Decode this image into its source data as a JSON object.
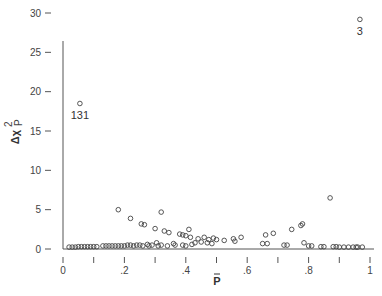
{
  "chart_data": {
    "type": "scatter",
    "title": "",
    "xlabel": "P̂",
    "ylabel": "Δχ²_P",
    "xlim": [
      0,
      1
    ],
    "ylim": [
      0,
      30
    ],
    "grid": false,
    "legend": null,
    "x_ticks": [
      0,
      0.1,
      0.2,
      0.3,
      0.4,
      0.5,
      0.6,
      0.7,
      0.8,
      0.9,
      1
    ],
    "x_tick_labels": [
      "0",
      "",
      ".2",
      "",
      ".4",
      "",
      ".6",
      "",
      ".8",
      "",
      "1"
    ],
    "y_ticks": [
      0,
      5,
      10,
      15,
      20,
      25,
      30
    ],
    "y_tick_labels": [
      "0",
      "5",
      "10",
      "15",
      "20",
      "25",
      "30"
    ],
    "marker": "open-circle",
    "annotations": [
      {
        "label": "131",
        "x": 0.055,
        "y": 18.3
      },
      {
        "label": "3",
        "x": 0.967,
        "y": 29.0
      }
    ],
    "points": [
      {
        "x": 0.055,
        "y": 18.3
      },
      {
        "x": 0.967,
        "y": 29.0
      },
      {
        "x": 0.18,
        "y": 4.8
      },
      {
        "x": 0.22,
        "y": 3.7
      },
      {
        "x": 0.255,
        "y": 3.0
      },
      {
        "x": 0.265,
        "y": 2.9
      },
      {
        "x": 0.32,
        "y": 4.5
      },
      {
        "x": 0.3,
        "y": 2.4
      },
      {
        "x": 0.33,
        "y": 2.1
      },
      {
        "x": 0.345,
        "y": 1.9
      },
      {
        "x": 0.305,
        "y": 0.6
      },
      {
        "x": 0.275,
        "y": 0.4
      },
      {
        "x": 0.24,
        "y": 0.3
      },
      {
        "x": 0.38,
        "y": 1.7
      },
      {
        "x": 0.39,
        "y": 1.6
      },
      {
        "x": 0.4,
        "y": 1.5
      },
      {
        "x": 0.41,
        "y": 2.3
      },
      {
        "x": 0.415,
        "y": 1.3
      },
      {
        "x": 0.44,
        "y": 1.1
      },
      {
        "x": 0.46,
        "y": 1.3
      },
      {
        "x": 0.475,
        "y": 1.0
      },
      {
        "x": 0.49,
        "y": 1.2
      },
      {
        "x": 0.5,
        "y": 1.0
      },
      {
        "x": 0.525,
        "y": 0.9
      },
      {
        "x": 0.555,
        "y": 1.1
      },
      {
        "x": 0.56,
        "y": 0.8
      },
      {
        "x": 0.58,
        "y": 1.3
      },
      {
        "x": 0.36,
        "y": 0.5
      },
      {
        "x": 0.365,
        "y": 0.3
      },
      {
        "x": 0.42,
        "y": 0.4
      },
      {
        "x": 0.43,
        "y": 0.6
      },
      {
        "x": 0.45,
        "y": 0.7
      },
      {
        "x": 0.47,
        "y": 0.6
      },
      {
        "x": 0.485,
        "y": 0.5
      },
      {
        "x": 0.65,
        "y": 0.5
      },
      {
        "x": 0.665,
        "y": 0.5
      },
      {
        "x": 0.66,
        "y": 1.6
      },
      {
        "x": 0.685,
        "y": 1.8
      },
      {
        "x": 0.72,
        "y": 0.3
      },
      {
        "x": 0.73,
        "y": 0.3
      },
      {
        "x": 0.745,
        "y": 2.3
      },
      {
        "x": 0.775,
        "y": 2.8
      },
      {
        "x": 0.78,
        "y": 3.0
      },
      {
        "x": 0.785,
        "y": 0.6
      },
      {
        "x": 0.8,
        "y": 0.2
      },
      {
        "x": 0.81,
        "y": 0.2
      },
      {
        "x": 0.87,
        "y": 6.3
      },
      {
        "x": 0.84,
        "y": 0.1
      },
      {
        "x": 0.85,
        "y": 0.1
      },
      {
        "x": 0.88,
        "y": 0.1
      },
      {
        "x": 0.89,
        "y": 0.1
      },
      {
        "x": 0.9,
        "y": 0.05
      },
      {
        "x": 0.915,
        "y": 0.05
      },
      {
        "x": 0.93,
        "y": 0.05
      },
      {
        "x": 0.945,
        "y": 0.05
      },
      {
        "x": 0.955,
        "y": 0.05
      },
      {
        "x": 0.96,
        "y": 0.05
      },
      {
        "x": 0.975,
        "y": 0.05
      },
      {
        "x": 0.02,
        "y": 0.05
      },
      {
        "x": 0.03,
        "y": 0.05
      },
      {
        "x": 0.04,
        "y": 0.05
      },
      {
        "x": 0.05,
        "y": 0.1
      },
      {
        "x": 0.06,
        "y": 0.1
      },
      {
        "x": 0.07,
        "y": 0.1
      },
      {
        "x": 0.08,
        "y": 0.1
      },
      {
        "x": 0.09,
        "y": 0.1
      },
      {
        "x": 0.1,
        "y": 0.1
      },
      {
        "x": 0.11,
        "y": 0.1
      },
      {
        "x": 0.13,
        "y": 0.2
      },
      {
        "x": 0.14,
        "y": 0.2
      },
      {
        "x": 0.15,
        "y": 0.2
      },
      {
        "x": 0.16,
        "y": 0.2
      },
      {
        "x": 0.17,
        "y": 0.2
      },
      {
        "x": 0.18,
        "y": 0.2
      },
      {
        "x": 0.19,
        "y": 0.2
      },
      {
        "x": 0.2,
        "y": 0.2
      },
      {
        "x": 0.21,
        "y": 0.3
      },
      {
        "x": 0.22,
        "y": 0.3
      },
      {
        "x": 0.23,
        "y": 0.2
      },
      {
        "x": 0.25,
        "y": 0.3
      },
      {
        "x": 0.26,
        "y": 0.2
      },
      {
        "x": 0.28,
        "y": 0.2
      },
      {
        "x": 0.29,
        "y": 0.3
      },
      {
        "x": 0.31,
        "y": 0.2
      },
      {
        "x": 0.32,
        "y": 0.3
      },
      {
        "x": 0.34,
        "y": 0.2
      },
      {
        "x": 0.39,
        "y": 0.3
      },
      {
        "x": 0.4,
        "y": 0.2
      }
    ]
  }
}
